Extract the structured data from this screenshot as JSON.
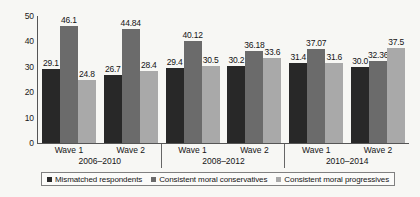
{
  "chart_data": {
    "type": "bar",
    "title": "",
    "xlabel": "",
    "ylabel": "",
    "ylim": [
      0,
      50
    ],
    "yticks": [
      "0",
      "10",
      "20",
      "30",
      "40",
      "50"
    ],
    "grid": false,
    "legend_position": "bottom",
    "categories": [
      "Wave 1",
      "Wave 2",
      "Wave 1",
      "Wave 2",
      "Wave 1",
      "Wave 2"
    ],
    "group_labels": [
      "2006–2010",
      "2008–2012",
      "2010–2014"
    ],
    "series": [
      {
        "name": "Mismatched respondents",
        "color": "#282828",
        "values": [
          29.1,
          26.7,
          29.4,
          30.2,
          31.4,
          30.0
        ],
        "labels": [
          "29.1",
          "26.7",
          "29.4",
          "30.2",
          "31.4",
          "30.0"
        ]
      },
      {
        "name": "Consistent moral conservatives",
        "color": "#6b6b6b",
        "values": [
          46.1,
          44.84,
          40.12,
          36.18,
          37.07,
          32.36
        ],
        "labels": [
          "46.1",
          "44.84",
          "40.12",
          "36.18",
          "37.07",
          "32.36"
        ]
      },
      {
        "name": "Consistent moral progressives",
        "color": "#a9a9a9",
        "values": [
          24.8,
          28.4,
          30.5,
          33.6,
          31.6,
          37.5
        ],
        "labels": [
          "24.8",
          "28.4",
          "30.5",
          "33.6",
          "31.6",
          "37.5"
        ]
      }
    ]
  },
  "legend": {
    "items": [
      {
        "label": "Mismatched respondents"
      },
      {
        "label": "Consistent moral conservatives"
      },
      {
        "label": "Consistent moral progressives"
      }
    ]
  }
}
